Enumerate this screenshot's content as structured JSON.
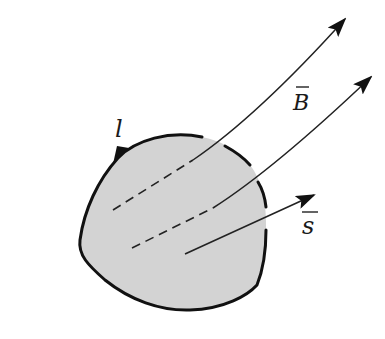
{
  "figure": {
    "colors": {
      "background": "#ffffff",
      "surface_fill": "#d3d3d3",
      "stroke": "#111111"
    },
    "labels": {
      "contour": "l",
      "field": "B",
      "normal": "s"
    },
    "elements": [
      {
        "id": "surface",
        "type": "closed-region",
        "label": "l"
      },
      {
        "id": "field-line-1",
        "type": "arrow",
        "label": "B",
        "dashed_inside_surface": true
      },
      {
        "id": "field-line-2",
        "type": "arrow",
        "label": "B",
        "dashed_inside_surface": true
      },
      {
        "id": "normal-vector",
        "type": "arrow",
        "label": "s"
      }
    ]
  }
}
